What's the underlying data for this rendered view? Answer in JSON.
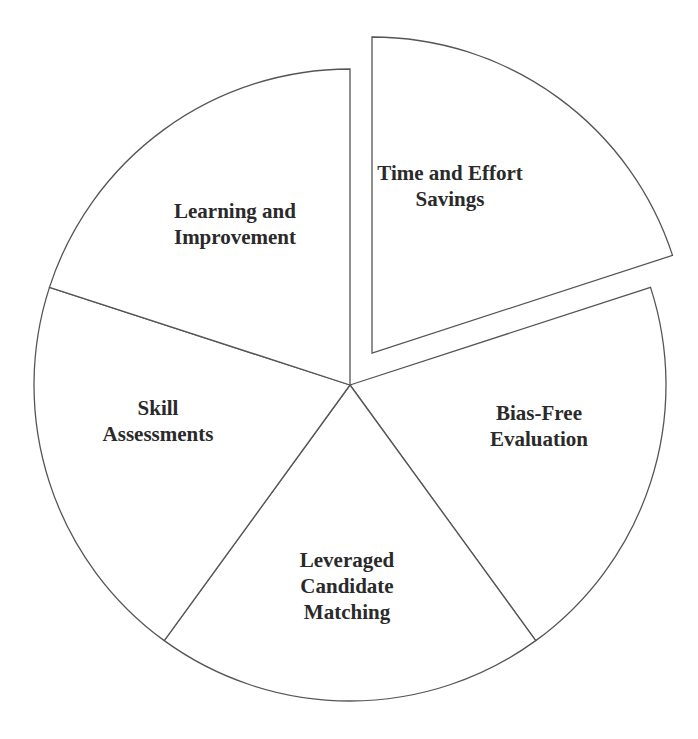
{
  "chart_data": {
    "type": "pie",
    "title": "",
    "center": [
      350,
      385
    ],
    "radius": 316,
    "start_angle_deg": -90,
    "slices": [
      {
        "label": "Time and Effort Savings",
        "lines": [
          "Time and Effort",
          "Savings"
        ],
        "value": 20,
        "exploded": true,
        "label_pos": [
          450,
          186
        ]
      },
      {
        "label": "Bias-Free Evaluation",
        "lines": [
          "Bias-Free",
          "Evaluation"
        ],
        "value": 20,
        "exploded": false,
        "label_pos": [
          539,
          426
        ]
      },
      {
        "label": "Leveraged Candidate Matching",
        "lines": [
          "Leveraged",
          "Candidate",
          "Matching"
        ],
        "value": 20,
        "exploded": false,
        "label_pos": [
          347,
          586
        ]
      },
      {
        "label": "Skill Assessments",
        "lines": [
          "Skill",
          "Assessments"
        ],
        "value": 20,
        "exploded": false,
        "label_pos": [
          158,
          421
        ]
      },
      {
        "label": "Learning and Improvement",
        "lines": [
          "Learning and",
          "Improvement"
        ],
        "value": 20,
        "exploded": false,
        "label_pos": [
          235,
          224
        ]
      }
    ],
    "explode_offset": [
      22,
      -32
    ],
    "fill_color": "#ffffff",
    "stroke_color": "#555555",
    "legend": "none"
  }
}
